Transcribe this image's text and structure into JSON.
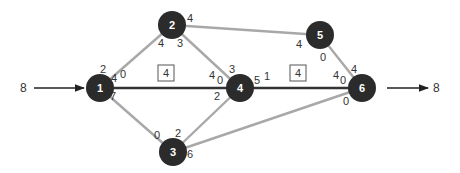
{
  "diagram": {
    "type": "flow-network",
    "colors": {
      "node_fill": "#2b2b2b",
      "node_text": "#ffffff",
      "edge_gray": "#a8a8a8",
      "edge_main": "#333333",
      "arrow": "#222222",
      "label_text": "#333333"
    },
    "source_flow": {
      "label": "8"
    },
    "sink_flow": {
      "label": "8"
    },
    "nodes": [
      {
        "id": "1",
        "label": "1",
        "x": 100,
        "y": 88
      },
      {
        "id": "2",
        "label": "2",
        "x": 172,
        "y": 25
      },
      {
        "id": "3",
        "label": "3",
        "x": 173,
        "y": 152
      },
      {
        "id": "4",
        "label": "4",
        "x": 240,
        "y": 88
      },
      {
        "id": "5",
        "label": "5",
        "x": 320,
        "y": 35
      },
      {
        "id": "6",
        "label": "6",
        "x": 362,
        "y": 88
      }
    ],
    "edges": [
      {
        "from": "1",
        "to": "2",
        "style": "gray"
      },
      {
        "from": "1",
        "to": "3",
        "style": "gray"
      },
      {
        "from": "1",
        "to": "4",
        "style": "main"
      },
      {
        "from": "2",
        "to": "4",
        "style": "gray"
      },
      {
        "from": "2",
        "to": "5",
        "style": "gray"
      },
      {
        "from": "3",
        "to": "4",
        "style": "gray"
      },
      {
        "from": "3",
        "to": "6",
        "style": "gray"
      },
      {
        "from": "4",
        "to": "6",
        "style": "main"
      },
      {
        "from": "5",
        "to": "6",
        "style": "gray"
      }
    ],
    "edge_labels": [
      {
        "text": "2",
        "x": 103,
        "y": 73,
        "near": "node-1",
        "edge": "1-2"
      },
      {
        "text": "4",
        "x": 114,
        "y": 82,
        "near": "node-1",
        "edge": "1-4"
      },
      {
        "text": "0",
        "x": 123,
        "y": 78,
        "near": "node-1",
        "edge": "1-4"
      },
      {
        "text": "7",
        "x": 113,
        "y": 100,
        "near": "node-1",
        "edge": "1-3"
      },
      {
        "text": "4",
        "x": 190,
        "y": 22,
        "near": "node-2",
        "edge": "2-5"
      },
      {
        "text": "4",
        "x": 161,
        "y": 47,
        "near": "node-2",
        "edge": "1-2"
      },
      {
        "text": "3",
        "x": 180,
        "y": 47,
        "near": "node-2",
        "edge": "2-4"
      },
      {
        "text": "0",
        "x": 157,
        "y": 139,
        "near": "node-3",
        "edge": "1-3"
      },
      {
        "text": "2",
        "x": 178,
        "y": 137,
        "near": "node-3",
        "edge": "3-4"
      },
      {
        "text": "6",
        "x": 190,
        "y": 158,
        "near": "node-3",
        "edge": "3-6"
      },
      {
        "text": "4",
        "x": 212,
        "y": 79,
        "near": "node-4",
        "edge": "1-4"
      },
      {
        "text": "0",
        "x": 220,
        "y": 84,
        "near": "node-4",
        "edge": "1-4"
      },
      {
        "text": "3",
        "x": 232,
        "y": 73,
        "near": "node-4",
        "edge": "2-4"
      },
      {
        "text": "2",
        "x": 217,
        "y": 100,
        "near": "node-4",
        "edge": "3-4"
      },
      {
        "text": "5",
        "x": 257,
        "y": 84,
        "near": "node-4",
        "edge": "4-6"
      },
      {
        "text": "1",
        "x": 267,
        "y": 80,
        "near": "node-4",
        "edge": "4-6"
      },
      {
        "text": "4",
        "x": 299,
        "y": 48,
        "near": "node-5",
        "edge": "2-5"
      },
      {
        "text": "0",
        "x": 323,
        "y": 61,
        "near": "node-5",
        "edge": "5-6"
      },
      {
        "text": "4",
        "x": 336,
        "y": 79,
        "near": "node-6",
        "edge": "4-6"
      },
      {
        "text": "0",
        "x": 343,
        "y": 84,
        "near": "node-6",
        "edge": "4-6"
      },
      {
        "text": "4",
        "x": 354,
        "y": 73,
        "near": "node-6",
        "edge": "5-6"
      },
      {
        "text": "0",
        "x": 346,
        "y": 105,
        "near": "node-6",
        "edge": "3-6"
      }
    ],
    "boxed_labels": [
      {
        "text": "4",
        "x": 158,
        "y": 65,
        "edge": "1-4"
      },
      {
        "text": "4",
        "x": 290,
        "y": 65,
        "edge": "4-6"
      }
    ]
  }
}
